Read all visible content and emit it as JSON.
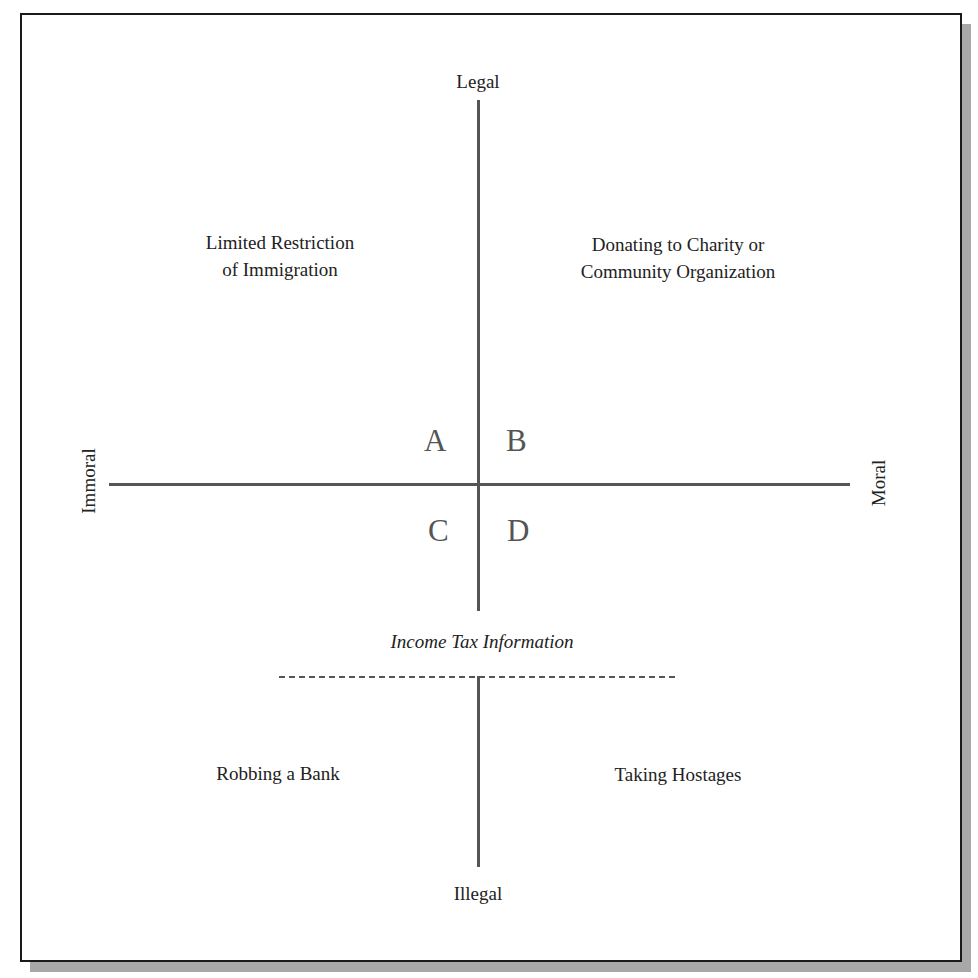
{
  "diagram": {
    "axes": {
      "top": "Legal",
      "bottom": "Illegal",
      "left": "Immoral",
      "right": "Moral"
    },
    "quadrants": {
      "A": "A",
      "B": "B",
      "C": "C",
      "D": "D"
    },
    "examples": {
      "top_left": [
        "Limited Restriction",
        "of Immigration"
      ],
      "top_right": [
        "Donating to Charity or",
        "Community Organization"
      ],
      "middle": "Income Tax Information",
      "bottom_left": "Robbing a Bank",
      "bottom_right": "Taking Hostages"
    },
    "colors": {
      "line": "#555555",
      "border": "#1a1a1a",
      "shadow": "#a8a8a8"
    }
  }
}
